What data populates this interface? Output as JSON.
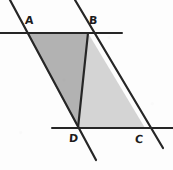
{
  "figure": {
    "background_color": "#fdfdfd",
    "stroke_color": "#262626",
    "label_color": "#1c1c1c",
    "shade_left_color": "#b2b2b2",
    "shade_right_color": "#d4d4d4",
    "canvas": {
      "width": 173,
      "height": 170
    }
  },
  "points": {
    "A": {
      "label": "A",
      "x": 27,
      "y": 33
    },
    "B": {
      "label": "B",
      "x": 88,
      "y": 33
    },
    "C": {
      "label": "C",
      "x": 145,
      "y": 128
    },
    "D": {
      "label": "D",
      "x": 78,
      "y": 128
    }
  },
  "lines": [
    {
      "name": "top-parallel-line",
      "x1": 0,
      "y1": 33,
      "x2": 122,
      "y2": 33,
      "width": 2.0
    },
    {
      "name": "bottom-parallel-line",
      "x1": 52,
      "y1": 128,
      "x2": 173,
      "y2": 128,
      "width": 2.0
    },
    {
      "name": "transversal-left",
      "x1": 10,
      "y1": 0,
      "x2": 96,
      "y2": 160,
      "width": 2.2
    },
    {
      "name": "transversal-right",
      "x1": 75,
      "y1": 0,
      "x2": 163,
      "y2": 148,
      "width": 2.2
    },
    {
      "name": "segment-b-to-d",
      "x1": 88,
      "y1": 33,
      "x2": 78,
      "y2": 128,
      "width": 2.2
    }
  ],
  "regions": [
    {
      "name": "triangle-abd",
      "vertices": "27,33 88,33 78,128",
      "fill": "#b2b2b2"
    },
    {
      "name": "triangle-bdc",
      "vertices": "88,33 145,128 78,128",
      "fill": "#d4d4d4"
    }
  ]
}
